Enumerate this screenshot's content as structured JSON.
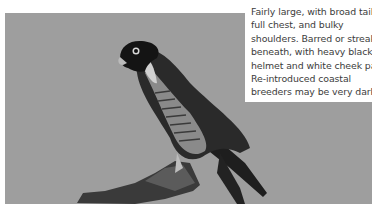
{
  "photo": {
    "subject": "Peregrine falcon perched on branch",
    "background_color": "#9e9e9e"
  },
  "caption": {
    "lines": [
      "Fairly large, with broad tail,",
      "full chest, and bulky",
      "shoulders. Barred or streaked",
      "beneath, with heavy black",
      "helmet and white cheek patch.",
      "Re-introduced coastal",
      "breeders may be very dark."
    ]
  }
}
